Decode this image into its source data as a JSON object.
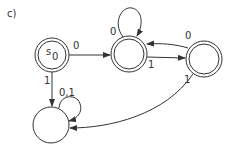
{
  "figure": {
    "label": "c)"
  },
  "states": [
    {
      "id": "s0",
      "label": "s",
      "subscript": "0",
      "accepting": true
    },
    {
      "id": "q1",
      "label": "",
      "accepting": true
    },
    {
      "id": "q2",
      "label": "",
      "accepting": true
    },
    {
      "id": "q3",
      "label": "",
      "accepting": false
    }
  ],
  "transitions": [
    {
      "from": "s0",
      "to": "q1",
      "label": "0"
    },
    {
      "from": "s0",
      "to": "q3",
      "label": "1"
    },
    {
      "from": "q1",
      "to": "q1",
      "label": "0"
    },
    {
      "from": "q1",
      "to": "q2",
      "label": "1"
    },
    {
      "from": "q2",
      "to": "q1",
      "label": "0"
    },
    {
      "from": "q2",
      "to": "q3",
      "label": "1"
    },
    {
      "from": "q3",
      "to": "q3",
      "label": "0,1"
    }
  ],
  "colors": {
    "stroke": "#333333",
    "background": "#ffffff"
  }
}
